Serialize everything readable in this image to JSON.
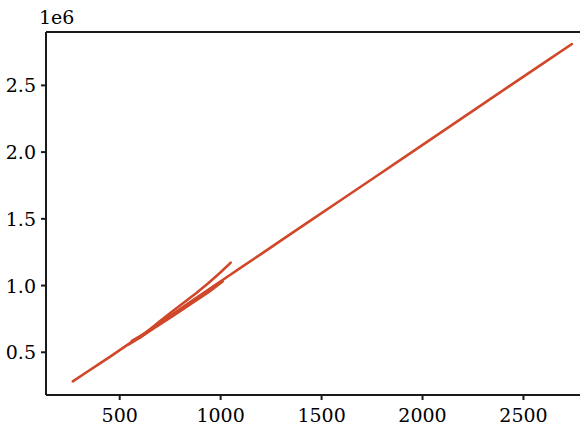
{
  "chart_data": {
    "type": "line",
    "title": "",
    "xlabel": "",
    "ylabel": "",
    "y_offset_text": "1e6",
    "y_offset_multiplier": 1000000,
    "xlim": [
      135,
      2780
    ],
    "ylim": [
      180000,
      2900000
    ],
    "grid": false,
    "legend": null,
    "line_color": "#d0472a",
    "line_width": 2.6,
    "axis_color": "#1a1a1a",
    "background_color": "#ffffff",
    "xticks": [
      500,
      1000,
      1500,
      2000,
      2500
    ],
    "xtick_labels": [
      "500",
      "1000",
      "1500",
      "2000",
      "2500"
    ],
    "yticks": [
      500000,
      1000000,
      1500000,
      2000000,
      2500000
    ],
    "ytick_labels": [
      "0.5",
      "1.0",
      "1.5",
      "2.0",
      "2.5"
    ],
    "series": [
      {
        "name": "main-trend",
        "points_x": [
          268,
          330,
          395,
          455,
          520,
          560,
          600,
          640,
          690,
          740,
          790,
          840,
          900,
          960,
          1030,
          1100,
          1200,
          1320,
          1450,
          1600,
          1760,
          1920,
          2090,
          2260,
          2430,
          2590,
          2740
        ],
        "points_y": [
          282000,
          345000,
          410000,
          470000,
          537000,
          578000,
          618000,
          660000,
          712000,
          762000,
          815000,
          866000,
          928000,
          990000,
          1062000,
          1134000,
          1236000,
          1359000,
          1492000,
          1645000,
          1808000,
          1972000,
          2146000,
          2320000,
          2494000,
          2657000,
          2810000
        ]
      },
      {
        "name": "upper-branch",
        "points_x": [
          640,
          700,
          760,
          820,
          880,
          940,
          1000,
          1050
        ],
        "points_y": [
          660000,
          735000,
          805000,
          875000,
          945000,
          1020000,
          1100000,
          1172000
        ]
      },
      {
        "name": "tangle-segment-a",
        "points_x": [
          545,
          590,
          640,
          700,
          760,
          820,
          880
        ],
        "points_y": [
          560000,
          600000,
          655000,
          718000,
          778000,
          840000,
          905000
        ]
      },
      {
        "name": "tangle-segment-b",
        "points_x": [
          560,
          610,
          665,
          720,
          790,
          860,
          930
        ],
        "points_y": [
          585000,
          628000,
          678000,
          735000,
          805000,
          878000,
          952000
        ]
      },
      {
        "name": "tangle-segment-c",
        "points_x": [
          600,
          660,
          720,
          790,
          860,
          940,
          1010
        ],
        "points_y": [
          610000,
          672000,
          730000,
          798000,
          870000,
          950000,
          1030000
        ]
      }
    ]
  },
  "axes_geometry": {
    "left_px": 46,
    "top_px": 32,
    "bottom_px": 395,
    "right_px": 580
  }
}
